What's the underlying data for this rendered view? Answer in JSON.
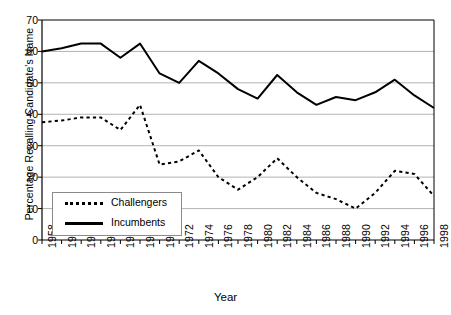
{
  "chart_data": {
    "type": "line",
    "title": "",
    "xlabel": "Year",
    "ylabel": "Percentage Recalling Candidate's Name",
    "xlim": [
      1958,
      1998
    ],
    "ylim": [
      0,
      70
    ],
    "ytick_step": 10,
    "grid": "horizontal",
    "legend_position": "inside-lower-left",
    "categories": [
      1958,
      1960,
      1962,
      1964,
      1966,
      1968,
      1970,
      1972,
      1974,
      1976,
      1978,
      1980,
      1982,
      1984,
      1986,
      1988,
      1990,
      1992,
      1994,
      1996,
      1998
    ],
    "xtick_labels": [
      "1958",
      "1960",
      "1962",
      "1964",
      "1966",
      "1968",
      "1970",
      "1972",
      "1974",
      "1976",
      "1978",
      "1980",
      "1982",
      "1984",
      "1986",
      "1988",
      "1990",
      "1992",
      "1994",
      "1996",
      "1998"
    ],
    "ytick_labels": [
      "0",
      "10",
      "20",
      "30",
      "40",
      "50",
      "60",
      "70"
    ],
    "ytick_values": [
      0,
      10,
      20,
      30,
      40,
      50,
      60,
      70
    ],
    "series": [
      {
        "name": "Incumbents",
        "style": "solid",
        "color": "#000000",
        "values": [
          60,
          61,
          62.5,
          62.5,
          58,
          62.5,
          53,
          50,
          57,
          53,
          48,
          45,
          52.5,
          47,
          43,
          45.5,
          44.5,
          47,
          51,
          46,
          42
        ]
      },
      {
        "name": "Challengers",
        "style": "dotted",
        "color": "#000000",
        "values": [
          37.5,
          38,
          39,
          39,
          35,
          43,
          24,
          25,
          28.5,
          20,
          16,
          20,
          26,
          20,
          15,
          13,
          10,
          15,
          22,
          21,
          14
        ]
      }
    ]
  },
  "legend": {
    "entries": [
      {
        "label": "Challengers",
        "style": "dotted"
      },
      {
        "label": "Incumbents",
        "style": "solid"
      }
    ]
  },
  "axes": {
    "x_title": "Year",
    "y_title": "Percentage Recalling Candidate's Name"
  }
}
